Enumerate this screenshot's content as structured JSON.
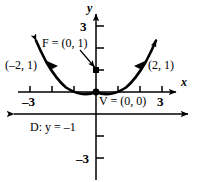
{
  "figure": {
    "axes": {
      "x_axis_name": "x",
      "y_axis_name": "y",
      "x_ticks": [
        -3,
        -2,
        -1,
        1,
        2,
        3
      ],
      "y_ticks": [
        1,
        2,
        3,
        -1,
        -2,
        -3
      ],
      "x_tick_labels": [
        {
          "value": -3,
          "text": "–3"
        },
        {
          "value": 3,
          "text": "3"
        }
      ],
      "y_tick_labels": [
        {
          "value": 3,
          "text": "3"
        },
        {
          "value": -3,
          "text": "–3"
        }
      ],
      "xlim": [
        -3.8,
        3.8
      ],
      "ylim": [
        -3.8,
        3.8
      ],
      "grid": false
    },
    "curve": {
      "type": "parabola",
      "equation": "x² = 4y",
      "opens": "up",
      "arrowheads": "both"
    },
    "points": [
      {
        "name": "focus",
        "label": "F = (0, 1)",
        "x": 0,
        "y": 1,
        "marker": "filled-square",
        "leader": true
      },
      {
        "name": "vertex",
        "label": "V = (0, 0)",
        "x": 0,
        "y": 0,
        "marker": "filled-dot",
        "leader": false
      },
      {
        "name": "left-point",
        "label": "(–2, 1)",
        "x": -2,
        "y": 1,
        "marker": "filled-triangle",
        "leader": false
      },
      {
        "name": "right-point",
        "label": "(2, 1)",
        "x": 2,
        "y": 1,
        "marker": "filled-triangle",
        "leader": false
      }
    ],
    "directrix": {
      "label": "D: y = –1",
      "y": -1,
      "arrowheads": "both"
    },
    "colors": {
      "stroke": "#000000",
      "background": "#ffffff"
    }
  }
}
